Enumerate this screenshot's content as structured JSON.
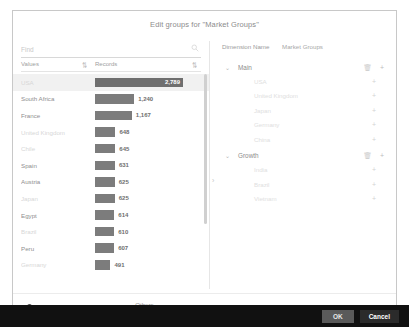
{
  "dialog": {
    "title": "Edit groups for \"Market Groups\""
  },
  "search": {
    "placeholder": "Find",
    "value": "",
    "icon": "search-icon"
  },
  "left_panel": {
    "columns": {
      "values_header": "Values",
      "records_header": "Records",
      "sort_glyph": "⇅"
    },
    "max_value": 2789,
    "rows": [
      {
        "label": "USA",
        "value": 2789,
        "display": "2,789",
        "faint": true,
        "selected": true
      },
      {
        "label": "South Africa",
        "value": 1240,
        "display": "1,240",
        "faint": false,
        "selected": false
      },
      {
        "label": "France",
        "value": 1167,
        "display": "1,167",
        "faint": false,
        "selected": false
      },
      {
        "label": "United Kingdom",
        "value": 648,
        "display": "648",
        "faint": true,
        "selected": false
      },
      {
        "label": "Chile",
        "value": 645,
        "display": "645",
        "faint": true,
        "selected": false
      },
      {
        "label": "Spain",
        "value": 631,
        "display": "631",
        "faint": false,
        "selected": false
      },
      {
        "label": "Austria",
        "value": 625,
        "display": "625",
        "faint": false,
        "selected": false
      },
      {
        "label": "Japan",
        "value": 625,
        "display": "625",
        "faint": true,
        "selected": false
      },
      {
        "label": "Egypt",
        "value": 614,
        "display": "614",
        "faint": false,
        "selected": false
      },
      {
        "label": "Brazil",
        "value": 610,
        "display": "610",
        "faint": true,
        "selected": false
      },
      {
        "label": "Peru",
        "value": 607,
        "display": "607",
        "faint": false,
        "selected": false
      },
      {
        "label": "Germany",
        "value": 491,
        "display": "491",
        "faint": true,
        "selected": false
      }
    ]
  },
  "right_panel": {
    "dimension_label": "Dimension Name",
    "dimension_value": "Market Groups",
    "chevron_glyph": "⌄",
    "trash_glyph": "🗑",
    "plus_glyph": "+",
    "groups": [
      {
        "name": "Main",
        "items": [
          {
            "label": "USA"
          },
          {
            "label": "United Kingdom"
          },
          {
            "label": "Japan"
          },
          {
            "label": "Germany"
          },
          {
            "label": "China"
          }
        ]
      },
      {
        "name": "Growth",
        "items": [
          {
            "label": "India"
          },
          {
            "label": "Brazil"
          },
          {
            "label": "Vietnam"
          }
        ]
      }
    ]
  },
  "options": {
    "group_remaining_label": "Group remaining values as:",
    "group_remaining_value": "Others"
  },
  "footer": {
    "ok_label": "OK",
    "cancel_label": "Cancel"
  }
}
